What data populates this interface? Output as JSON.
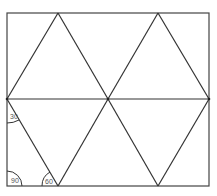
{
  "diagram": {
    "frame": {
      "x1": 7,
      "y1": 13,
      "x2": 209,
      "y2": 186
    },
    "midline_y": 99,
    "angles": [
      {
        "label": "30",
        "position": "left side below midline vertex"
      },
      {
        "label": "90",
        "position": "bottom-left corner"
      },
      {
        "label": "60",
        "position": "bottom vertex at x≈58"
      }
    ],
    "stroke_color": "#333333",
    "background": "#ffffff"
  }
}
